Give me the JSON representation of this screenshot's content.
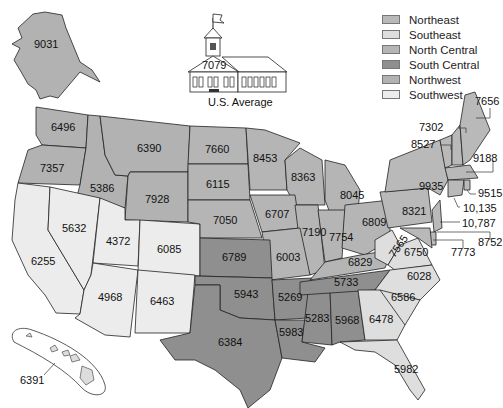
{
  "caption_fragment": "Figure ... expenditure per pupil by state (partially cut off)",
  "legend": {
    "items": [
      {
        "label": "Northeast",
        "color": "#b9b9b9"
      },
      {
        "label": "Southeast",
        "color": "#dedede"
      },
      {
        "label": "North Central",
        "color": "#b5b5b5"
      },
      {
        "label": "South Central",
        "color": "#8f8f8f"
      },
      {
        "label": "Northwest",
        "color": "#b2b2b2"
      },
      {
        "label": "Southwest",
        "color": "#ececec"
      }
    ]
  },
  "us_average": {
    "label": "U.S. Average",
    "value": "7079"
  },
  "states": {
    "AK": "9031",
    "HI": "6391",
    "WA": "6496",
    "OR": "7357",
    "ID": "5386",
    "MT": "6390",
    "WY": "7928",
    "CA": "6255",
    "NV": "5632",
    "UT": "4372",
    "CO": "6085",
    "AZ": "4968",
    "NM": "6463",
    "ND": "7660",
    "SD": "6115",
    "NE": "7050",
    "MN": "8453",
    "WI": "8363",
    "IA": "6707",
    "IL": "7190",
    "MO": "6003",
    "MI": "8045",
    "IN": "7754",
    "OH": "6809",
    "KS": "6789",
    "OK": "5943",
    "TX": "6384",
    "AR": "5269",
    "LA": "5983",
    "MS": "5283",
    "AL": "5968",
    "TN": "5733",
    "KY": "6829",
    "WV": "7565",
    "VA": "6750",
    "NC": "6028",
    "SC": "6586",
    "GA": "6478",
    "FL": "5982",
    "PA": "8321",
    "NY": "9935",
    "ME": "7656",
    "VT": "7302",
    "NH": "8527",
    "MA": "9188",
    "RI": "9515",
    "CT": "10,135",
    "NJ": "10,787",
    "DE": "8752",
    "MD": "7773"
  }
}
